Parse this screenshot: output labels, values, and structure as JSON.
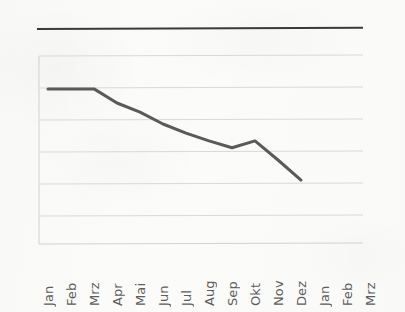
{
  "document": {
    "kind": "scanned-line-chart",
    "background_color": "#fbfbfa",
    "rule_color": "#3a3a3a"
  },
  "chart_data": {
    "type": "line",
    "title": "",
    "subtitle": "",
    "xlabel": "",
    "ylabel": "",
    "grid": true,
    "legend": false,
    "legend_position": "none",
    "line_color": "#5a5a5a",
    "grid_color": "#d9d9d9",
    "axis_color": "#d2d2d2",
    "categories": [
      "Jan",
      "Feb",
      "Mrz",
      "Apr",
      "Mai",
      "Jun",
      "Jul",
      "Aug",
      "Sep",
      "Okt",
      "Nov",
      "Dez",
      "Jan",
      "Feb",
      "Mrz"
    ],
    "series": [
      {
        "name": "",
        "values": [
          4.95,
          4.95,
          4.95,
          4.5,
          4.21,
          3.83,
          3.54,
          3.29,
          3.07,
          3.29,
          2.68,
          2.04,
          null,
          null,
          null
        ]
      }
    ],
    "ylim": [
      0,
      6
    ],
    "yticks": [
      0,
      1,
      2,
      3,
      4,
      5,
      6
    ],
    "ytick_labels": [
      "",
      "",
      "",
      "",
      "",
      "",
      ""
    ]
  },
  "x_labels": [
    {
      "label": "Jan"
    },
    {
      "label": "Feb"
    },
    {
      "label": "Mrz"
    },
    {
      "label": "Apr"
    },
    {
      "label": "Mai"
    },
    {
      "label": "Jun"
    },
    {
      "label": "Jul"
    },
    {
      "label": "Aug"
    },
    {
      "label": "Sep"
    },
    {
      "label": "Okt"
    },
    {
      "label": "Nov"
    },
    {
      "label": "Dez"
    },
    {
      "label": "Jan"
    },
    {
      "label": "Feb"
    },
    {
      "label": "Mrz"
    }
  ]
}
